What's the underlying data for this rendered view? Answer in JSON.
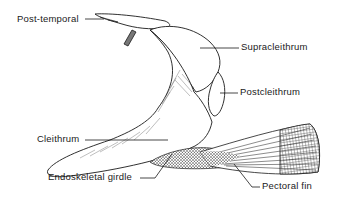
{
  "diagram": {
    "line_color": "#1a1a1a",
    "background": "#ffffff",
    "labels": [
      {
        "id": "post-temporal",
        "text": "Post-temporal"
      },
      {
        "id": "supracleithrum",
        "text": "Supracleithrum"
      },
      {
        "id": "postcleithrum",
        "text": "Postcleithrum"
      },
      {
        "id": "cleithrum",
        "text": "Cleithrum"
      },
      {
        "id": "endoskeletal-girdle",
        "text": "Endoskeletal girdle"
      },
      {
        "id": "pectoral-fin",
        "text": "Pectoral fin"
      }
    ]
  }
}
